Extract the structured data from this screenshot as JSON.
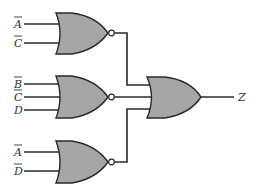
{
  "diagram": {
    "type": "logic-circuit",
    "colors": {
      "gate_fill": "#a6a6a6",
      "wire": "#2a2a2a",
      "background": "#ffffff"
    },
    "gates": [
      {
        "id": "nor1",
        "type": "NOR",
        "inputs": [
          {
            "label": "A",
            "complemented": true
          },
          {
            "label": "C",
            "complemented": true
          }
        ]
      },
      {
        "id": "nor2",
        "type": "NOR",
        "inputs": [
          {
            "label": "B",
            "complemented": true
          },
          {
            "label": "C",
            "complemented": true
          },
          {
            "label": "D",
            "complemented": false
          }
        ]
      },
      {
        "id": "nor3",
        "type": "NOR",
        "inputs": [
          {
            "label": "A",
            "complemented": true
          },
          {
            "label": "D",
            "complemented": true
          }
        ]
      },
      {
        "id": "or_out",
        "type": "OR",
        "inputs_from": [
          "nor1",
          "nor2",
          "nor3"
        ]
      }
    ],
    "output": {
      "label": "Z"
    }
  }
}
